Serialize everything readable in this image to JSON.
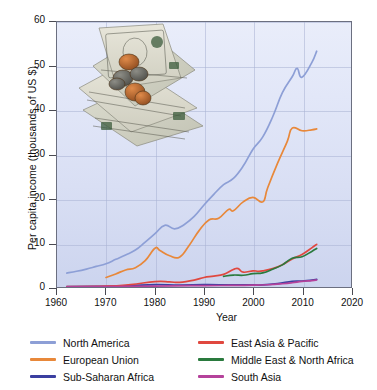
{
  "chart_data": {
    "type": "line",
    "title": "",
    "xlabel": "Year",
    "ylabel": "Per capita income (thousands of US $)",
    "xlim": [
      1960,
      2020
    ],
    "ylim": [
      0,
      60
    ],
    "xticks": [
      1960,
      1970,
      1980,
      1990,
      2000,
      2010,
      2020
    ],
    "yticks": [
      0,
      10,
      20,
      30,
      40,
      50,
      60
    ],
    "grid": true,
    "legend_position": "below-plot-two-columns",
    "series": [
      {
        "name": "North America",
        "color": "#8d9fd6",
        "x": [
          1962,
          1964,
          1966,
          1968,
          1970,
          1972,
          1974,
          1976,
          1978,
          1980,
          1982,
          1984,
          1986,
          1988,
          1990,
          1992,
          1994,
          1996,
          1998,
          2000,
          2002,
          2004,
          2006,
          2008,
          2009,
          2010,
          2012,
          2013
        ],
        "values": [
          3.2,
          3.6,
          4.1,
          4.7,
          5.3,
          6.3,
          7.3,
          8.4,
          10.2,
          12.1,
          14.0,
          13.2,
          14.2,
          16.0,
          18.6,
          21.0,
          23.2,
          24.6,
          27.4,
          31.2,
          34.0,
          38.5,
          44.0,
          47.6,
          49.5,
          47.5,
          50.8,
          53.4
        ]
      },
      {
        "name": "European Union",
        "color": "#e8883a",
        "x": [
          1970,
          1972,
          1974,
          1976,
          1978,
          1980,
          1981,
          1983,
          1985,
          1987,
          1989,
          1991,
          1993,
          1995,
          1996,
          1998,
          2000,
          2002,
          2003,
          2005,
          2007,
          2008,
          2010,
          2012,
          2013
        ],
        "values": [
          2.2,
          3.0,
          3.9,
          4.4,
          6.0,
          8.8,
          8.3,
          7.1,
          6.8,
          9.5,
          12.8,
          15.2,
          15.6,
          17.6,
          17.3,
          19.3,
          20.3,
          19.3,
          22.5,
          28.0,
          33.0,
          36.0,
          35.4,
          35.6,
          35.8
        ]
      },
      {
        "name": "Sub-Saharan Africa",
        "color": "#3b3fa0",
        "x": [
          1962,
          1970,
          1975,
          1980,
          1985,
          1990,
          1995,
          2000,
          2002,
          2005,
          2008,
          2010,
          2013
        ],
        "values": [
          0.14,
          0.2,
          0.35,
          0.6,
          0.48,
          0.56,
          0.53,
          0.5,
          0.52,
          0.82,
          1.3,
          1.4,
          1.75
        ]
      },
      {
        "name": "East Asia & Pacific",
        "color": "#e0483f",
        "x": [
          1962,
          1970,
          1975,
          1980,
          1983,
          1985,
          1988,
          1990,
          1992,
          1994,
          1996,
          1997,
          1998,
          2000,
          2001,
          2002,
          2004,
          2006,
          2008,
          2010,
          2012,
          2013
        ],
        "values": [
          0.14,
          0.24,
          0.6,
          1.25,
          1.2,
          1.1,
          1.6,
          2.2,
          2.5,
          2.9,
          4.0,
          4.2,
          3.4,
          3.7,
          3.6,
          3.7,
          4.2,
          5.1,
          6.4,
          7.4,
          8.9,
          9.7
        ]
      },
      {
        "name": "Middle East & North Africa",
        "color": "#2a7a3e",
        "x": [
          1994,
          1996,
          1998,
          2000,
          2002,
          2004,
          2006,
          2008,
          2010,
          2012,
          2013
        ],
        "values": [
          2.45,
          2.75,
          2.7,
          3.05,
          3.25,
          4.05,
          5.05,
          6.55,
          6.9,
          8.1,
          8.75
        ]
      },
      {
        "name": "South Asia",
        "color": "#b5429b",
        "x": [
          1962,
          1970,
          1980,
          1990,
          1995,
          2000,
          2003,
          2006,
          2008,
          2010,
          2012,
          2013
        ],
        "values": [
          0.1,
          0.12,
          0.26,
          0.36,
          0.39,
          0.45,
          0.55,
          0.78,
          1.0,
          1.3,
          1.5,
          1.62
        ]
      }
    ]
  },
  "legend": {
    "items": [
      {
        "label": "North America"
      },
      {
        "label": "East Asia & Pacific"
      },
      {
        "label": "European Union"
      },
      {
        "label": "Middle East & North Africa"
      },
      {
        "label": "Sub-Saharan Africa"
      },
      {
        "label": "South Asia"
      }
    ]
  },
  "decoration": {
    "money_photo": "us-dollar-bills-and-coins-photo"
  }
}
